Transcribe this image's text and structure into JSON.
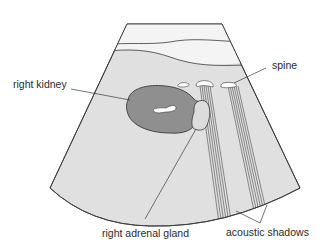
{
  "figure": {
    "type": "ultrasound-schematic",
    "labels": {
      "right_kidney": "right kidney",
      "spine": "spine",
      "right_adrenal_gland": "right adrenal gland",
      "acoustic_shadows": "acoustic shadows"
    },
    "colors": {
      "sector_fill": "#e0e0e0",
      "near_field_fill": "#f2f2f2",
      "kidney_fill": "#8f8f8f",
      "adrenal_fill": "#dcdcdc",
      "echo_fill": "#ffffff",
      "outline": "#3a3a3a"
    }
  }
}
